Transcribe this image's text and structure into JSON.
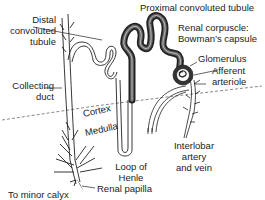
{
  "diagram": {
    "type": "anatomical-illustration",
    "colors": {
      "line": "#222222",
      "tubule_fill_dark": "#444444",
      "tubule_fill_light": "#ffffff",
      "background": "#ffffff",
      "boundary_dash": "#555555"
    },
    "labels": {
      "proximal": "Proximal convoluted tubule",
      "distal_1": "Distal",
      "distal_2": "convoluted",
      "distal_3": "tubule",
      "renal_corpuscle_1": "Renal corpuscle:",
      "renal_corpuscle_2": "Bowman’s capsule",
      "glomerulus": "Glomerulus",
      "afferent_1": "Afferent",
      "afferent_2": "arteriole",
      "collecting_1": "Collecting",
      "collecting_2": "duct",
      "cortex": "Cortex",
      "medulla": "Medulla",
      "interlobar_1": "Interlobar",
      "interlobar_2": "artery",
      "interlobar_3": "and vein",
      "loop_1": "Loop of",
      "loop_2": "Henle",
      "minor_calyx": "To minor calyx",
      "renal_papilla": "Renal papilla"
    },
    "regions": [
      "Cortex",
      "Medulla"
    ]
  }
}
